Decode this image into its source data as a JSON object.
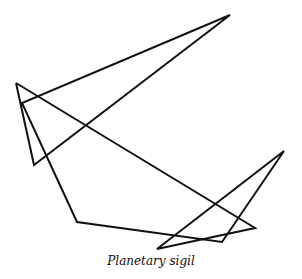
{
  "figure": {
    "caption": "Planetary sigil",
    "stroke_color": "#111111",
    "stroke_width": 2,
    "path_points": [
      [
        16,
        83
      ],
      [
        255,
        228
      ],
      [
        157,
        249
      ],
      [
        284,
        151
      ],
      [
        222,
        242
      ],
      [
        77,
        222
      ],
      [
        22,
        103
      ],
      [
        230,
        15
      ],
      [
        34,
        165
      ],
      [
        16,
        83
      ]
    ]
  }
}
